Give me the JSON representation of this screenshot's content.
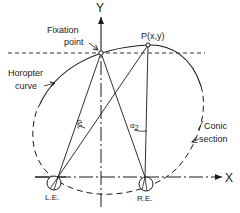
{
  "diagram": {
    "type": "geometric-figure",
    "colors": {
      "ink": "#1a1a1a",
      "background": "#ffffff"
    },
    "axes": {
      "x_label": "X",
      "y_label": "Y"
    },
    "points": {
      "fixation_label_line1": "Fixation",
      "fixation_label_line2": "point",
      "p_label": "P(x,y)"
    },
    "curves": {
      "horopter_line1": "Horopter",
      "horopter_line2": "curve",
      "conic_line1": "Conic",
      "conic_line2": "section"
    },
    "angles": {
      "alpha1": "α",
      "alpha1_sub": "1",
      "alpha2": "α",
      "alpha2_sub": "2"
    },
    "eyes": {
      "left": "L.E.",
      "right": "R.E."
    }
  }
}
